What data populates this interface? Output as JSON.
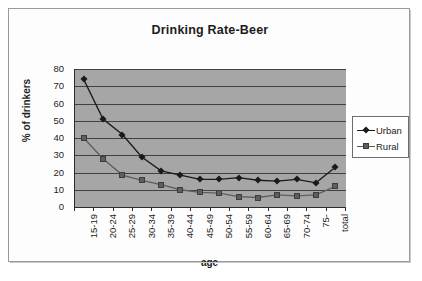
{
  "chart_data": {
    "type": "line",
    "title": "Drinking Rate-Beer",
    "xlabel": "age",
    "ylabel": "% of drinkers",
    "ylim": [
      0,
      80
    ],
    "ytick_step": 10,
    "yticks": [
      80,
      70,
      60,
      50,
      40,
      30,
      20,
      10,
      0
    ],
    "grid": true,
    "legend_position": "right",
    "categories": [
      "15-19",
      "20-24",
      "25-29",
      "30-34",
      "35-39",
      "40-44",
      "45-49",
      "50-54",
      "55-59",
      "60-64",
      "65-69",
      "70-74",
      "75-",
      "total"
    ],
    "series": [
      {
        "name": "Urban",
        "marker": "diamond",
        "color": "#1a1a1a",
        "values": [
          74,
          51,
          42,
          29,
          21,
          18.5,
          16,
          16,
          17,
          15.5,
          15,
          16,
          14,
          23
        ]
      },
      {
        "name": "Rural",
        "marker": "square",
        "color": "#5e5e5e",
        "values": [
          40,
          28,
          18.5,
          15.5,
          13,
          10,
          8.5,
          8,
          6,
          5.5,
          7,
          6.5,
          7,
          12
        ]
      }
    ]
  },
  "legend": {
    "entries": [
      {
        "label": "Urban"
      },
      {
        "label": "Rural"
      }
    ]
  }
}
